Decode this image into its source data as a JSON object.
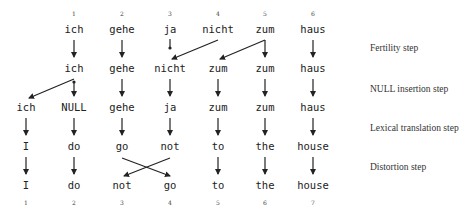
{
  "colors": {
    "text": "#222222",
    "arrow": "#222222",
    "background": "#ffffff"
  },
  "top_numbers": [
    "1",
    "2",
    "3",
    "4",
    "5",
    "6"
  ],
  "bottom_numbers": [
    "1",
    "2",
    "3",
    "4",
    "5",
    "6",
    "7"
  ],
  "rows": {
    "source": [
      "ich",
      "gehe",
      "ja",
      "nicht",
      "zum",
      "haus"
    ],
    "after_fertility": [
      "ich",
      "gehe",
      "nicht",
      "zum",
      "zum",
      "haus"
    ],
    "after_null_insertion": [
      "ich",
      "NULL",
      "gehe",
      "ja",
      "zum",
      "zum",
      "haus"
    ],
    "after_lexical_translation": [
      "I",
      "do",
      "go",
      "not",
      "to",
      "the",
      "house"
    ],
    "after_distortion": [
      "I",
      "do",
      "not",
      "go",
      "to",
      "the",
      "house"
    ]
  },
  "steps": {
    "fertility": "Fertility step",
    "null_insertion": "NULL insertion step",
    "lexical_translation": "Lexical translation step",
    "distortion": "Distortion step"
  }
}
